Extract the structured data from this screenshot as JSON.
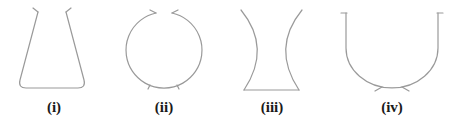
{
  "figure": {
    "stroke_color": "#9a9a9a",
    "label_color": "#1a1a1a",
    "vessels": [
      {
        "id": "i",
        "label": "(i)",
        "shape": "conical flask"
      },
      {
        "id": "ii",
        "label": "(ii)",
        "shape": "spherical vessel"
      },
      {
        "id": "iii",
        "label": "(iii)",
        "shape": "concave-sided vessel"
      },
      {
        "id": "iv",
        "label": "(iv)",
        "shape": "U-shaped vessel"
      }
    ]
  }
}
